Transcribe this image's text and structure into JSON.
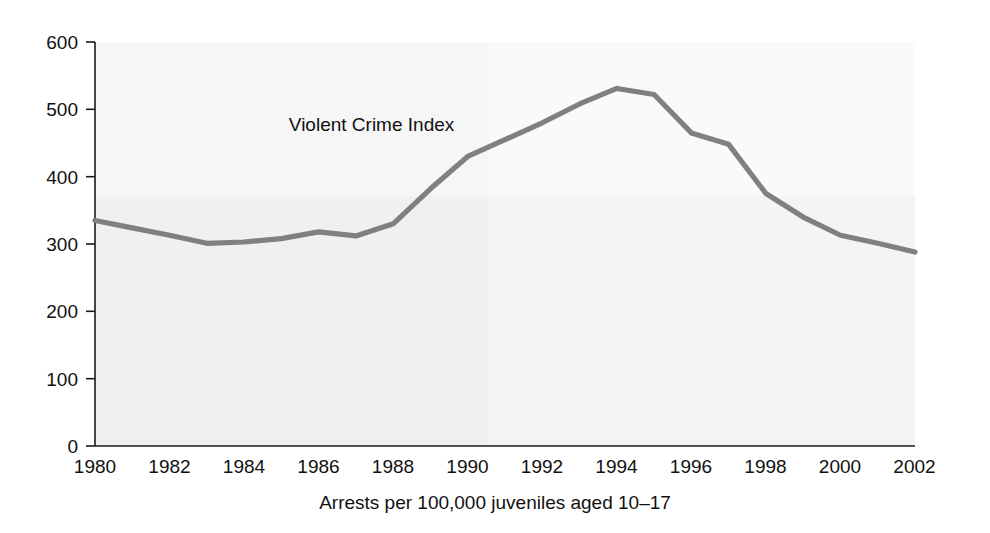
{
  "figure": {
    "background_color": "#ffffff",
    "plot_area": {
      "left": 95,
      "top": 42,
      "width": 820,
      "height": 404
    }
  },
  "chart_data": {
    "type": "line",
    "title": "",
    "subtitle": "",
    "xlabel": "Arrests per 100,000 juveniles aged 10–17",
    "ylabel": "",
    "xlim": [
      1980,
      2002
    ],
    "ylim": [
      0,
      600
    ],
    "grid": false,
    "legend_position": "inline-annotation",
    "annotations": [
      {
        "text": "Violent Crime Index",
        "x": 1985.2,
        "y": 468
      }
    ],
    "y_ticks": [
      0,
      100,
      200,
      300,
      400,
      500,
      600
    ],
    "y_tick_labels": [
      "0",
      "100",
      "200",
      "300",
      "400",
      "500",
      "600"
    ],
    "x_ticks": [
      1980,
      1982,
      1984,
      1986,
      1988,
      1990,
      1992,
      1994,
      1996,
      1998,
      2000,
      2002
    ],
    "x_tick_labels": [
      "1980",
      "1982",
      "1984",
      "1986",
      "1988",
      "1990",
      "1992",
      "1994",
      "1996",
      "1998",
      "2000",
      "2002"
    ],
    "series": [
      {
        "name": "Violent Crime Index",
        "color": "#808080",
        "line_width": 5.2,
        "x": [
          1980,
          1981,
          1982,
          1983,
          1984,
          1985,
          1986,
          1987,
          1988,
          1989,
          1990,
          1991,
          1992,
          1993,
          1994,
          1995,
          1996,
          1997,
          1998,
          1999,
          2000,
          2001,
          2002
        ],
        "values": [
          335,
          324,
          313,
          301,
          303,
          308,
          318,
          312,
          330,
          382,
          430,
          455,
          480,
          508,
          531,
          522,
          465,
          448,
          375,
          340,
          313,
          301,
          288
        ]
      }
    ]
  },
  "colors": {
    "line": "#808080",
    "axis": "#1a1a1a",
    "text": "#111111",
    "background": "#ffffff"
  }
}
